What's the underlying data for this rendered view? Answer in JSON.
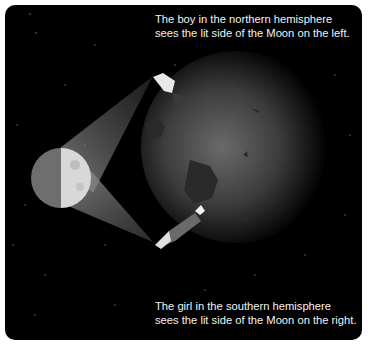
{
  "diagram": {
    "captions": {
      "top_line1": "The boy in the northern hemisphere",
      "top_line2": "sees the lit side of the Moon on the left.",
      "bottom_line1": "The girl in the southern hemisphere",
      "bottom_line2": "sees the lit side of the Moon on the right."
    },
    "elements": {
      "moon": {
        "label": "Moon",
        "lit_side_in_image": "right"
      },
      "earth": {
        "label": "Earth"
      },
      "observer_north": {
        "label": "boy (northern hemisphere)"
      },
      "observer_south": {
        "label": "girl (southern hemisphere)"
      }
    },
    "colors": {
      "background": "#000000",
      "frame": "#ffffff",
      "text": "#f2f2f2",
      "moon_lit": "#d8d8d8",
      "moon_dark": "#6e6e6e",
      "earth_center": "#6a6a6a"
    }
  }
}
